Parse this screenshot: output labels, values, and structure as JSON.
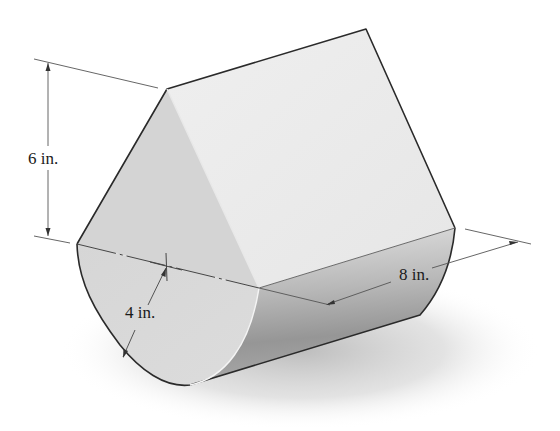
{
  "figure": {
    "colors": {
      "outline": "#2a2a2a",
      "dim_line": "#555555",
      "end_face": "#d9d9d9",
      "top_face": "#ececec",
      "curved_face_light": "#dedede",
      "curved_face_dark": "#9a9a9a",
      "shadow": "#bdbdbd"
    }
  },
  "dimensions": {
    "height": {
      "value": "6",
      "unit": "in.",
      "text": "6 in."
    },
    "radius": {
      "value": "4",
      "unit": "in.",
      "text": "4 in."
    },
    "length": {
      "value": "8",
      "unit": "in.",
      "text": "8 in."
    }
  }
}
